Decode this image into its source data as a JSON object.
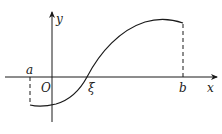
{
  "diagram": {
    "type": "function-graph",
    "axes": {
      "x_label": "x",
      "y_label": "y",
      "origin_label": "O"
    },
    "points": {
      "a_label": "a",
      "xi_label": "ξ",
      "b_label": "b"
    },
    "colors": {
      "stroke": "#1a1a1a",
      "background": "#ffffff"
    }
  }
}
